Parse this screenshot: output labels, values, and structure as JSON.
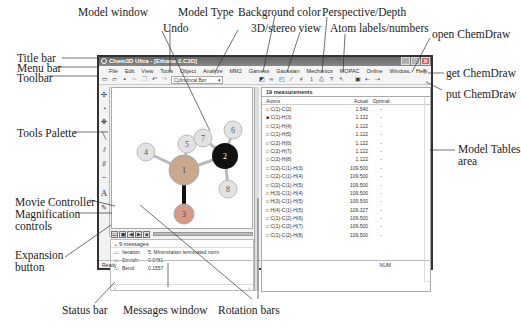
{
  "app": {
    "title": "Chem3D Ultra - [Ethane-2.C3D]",
    "window_buttons": [
      "_",
      "□",
      "X"
    ],
    "menu": [
      "File",
      "Edit",
      "View",
      "Tools",
      "Object",
      "Analyze",
      "MM2",
      "Gaussian",
      "Gaussian",
      "MOPAC Interface",
      "MOPAC",
      "Online",
      "Window",
      "Help"
    ],
    "menu_visible": [
      "File",
      "Edit",
      "View",
      "Tools",
      "Object",
      "Analyze",
      "MM2",
      "Gamess",
      "Gaussian",
      "Mechanics",
      "MOPAC",
      "Online",
      "Window",
      "Help"
    ],
    "model_type": "Cylindrical Bor",
    "toolbar_icons": [
      "new-icon",
      "open-icon",
      "save-icon",
      "cut-icon",
      "copy-icon",
      "undo-icon",
      "redo-icon",
      "model-type-select",
      "background-color-icon",
      "stereo-icon",
      "perspective-icon",
      "depth-icon",
      "atom-labels-icon",
      "atom-numbers-icon",
      "print-icon",
      "open-chemdraw-icon",
      "get-chemdraw-icon",
      "put-chemdraw-icon"
    ]
  },
  "palette": [
    "rotate",
    "select",
    "translate",
    "zoom",
    "single-bond",
    "double-bond",
    "triple-bond",
    "dummy-bond",
    "text"
  ],
  "molecule": {
    "atoms": [
      {
        "n": "1",
        "el": "C",
        "x": 72,
        "y": 82,
        "r": 15,
        "fill": "#c9a98e"
      },
      {
        "n": "2",
        "el": "C",
        "x": 113,
        "y": 68,
        "r": 13,
        "fill": "#111"
      },
      {
        "n": "3",
        "el": "H",
        "x": 72,
        "y": 126,
        "r": 10,
        "fill": "#d49a85"
      },
      {
        "n": "4",
        "el": "H",
        "x": 34,
        "y": 64,
        "r": 9,
        "fill": "#e2e2e2"
      },
      {
        "n": "5",
        "el": "H",
        "x": 75,
        "y": 56,
        "r": 9,
        "fill": "#e2e2e2"
      },
      {
        "n": "6",
        "el": "H",
        "x": 121,
        "y": 42,
        "r": 9,
        "fill": "#e2e2e2"
      },
      {
        "n": "7",
        "el": "H",
        "x": 91,
        "y": 50,
        "r": 9,
        "fill": "#e2e2e2"
      },
      {
        "n": "8",
        "el": "H",
        "x": 116,
        "y": 101,
        "r": 9,
        "fill": "#e2e2e2"
      }
    ]
  },
  "movie_buttons": [
    "◀",
    "▶",
    "|",
    "‖",
    "■"
  ],
  "messages": {
    "header": "9 messages",
    "rows": [
      {
        "key": "Iteration",
        "value": "5: Minimization terminated norm"
      },
      {
        "key": "Stretch:",
        "value": "0.0481"
      },
      {
        "key": "Bend:",
        "value": "0.1557"
      }
    ]
  },
  "tables": {
    "caption": "19 measurements",
    "columns": [
      "Atoms",
      "Actual",
      "Optimal"
    ],
    "rows": [
      {
        "atoms": "C(1)-C(2)",
        "actual": "1.540",
        "optimal": "-"
      },
      {
        "atoms": "C(1)-H(3)",
        "actual": "1.122",
        "optimal": "-"
      },
      {
        "atoms": "C(1)-H(4)",
        "actual": "1.122",
        "optimal": "-"
      },
      {
        "atoms": "C(1)-H(5)",
        "actual": "1.122",
        "optimal": "-"
      },
      {
        "atoms": "C(2)-H(6)",
        "actual": "1.122",
        "optimal": "-"
      },
      {
        "atoms": "C(2)-H(7)",
        "actual": "1.122",
        "optimal": "-"
      },
      {
        "atoms": "C(2)-H(8)",
        "actual": "1.122",
        "optimal": "-"
      },
      {
        "atoms": "C(2)-C(1)-H(3)",
        "actual": "109.500",
        "optimal": "-"
      },
      {
        "atoms": "C(2)-C(1)-H(4)",
        "actual": "109.500",
        "optimal": "-"
      },
      {
        "atoms": "C(2)-C(1)-H(5)",
        "actual": "109.500",
        "optimal": "-"
      },
      {
        "atoms": "H(3)-C(1)-H(4)",
        "actual": "109.500",
        "optimal": "-"
      },
      {
        "atoms": "H(3)-C(1)-H(5)",
        "actual": "109.500",
        "optimal": "-"
      },
      {
        "atoms": "H(4)-C(1)-H(5)",
        "actual": "109.327",
        "optimal": "-"
      },
      {
        "atoms": "C(1)-C(2)-H(6)",
        "actual": "109.500",
        "optimal": "-"
      },
      {
        "atoms": "C(1)-C(2)-H(7)",
        "actual": "109.500",
        "optimal": "-"
      },
      {
        "atoms": "C(1)-C(2)-H(8)",
        "actual": "109.500",
        "optimal": "-"
      }
    ]
  },
  "status": {
    "left": "Ready",
    "right": "NUM"
  },
  "callouts": {
    "model_window": "Model window",
    "model_type": "Model Type",
    "background_color": "Background color",
    "perspective": "Perspective/Depth",
    "undo": "Undo",
    "stereo": "3D/stereo view",
    "atom_labels": "Atom labels/numbers",
    "open_chemdraw": "open ChemDraw",
    "title_bar": "Title bar",
    "menu_bar": "Menu bar",
    "toolbar": "Toolbar",
    "get_chemdraw": "get ChemDraw",
    "put_chemdraw": "put ChemDraw",
    "tools_palette": "Tools Palette",
    "model_tables": "Model Tables",
    "model_tables_2": "area",
    "movie_controller": "Movie Controller",
    "magnification": "Magnification",
    "magnification_2": "controls",
    "expansion": "Expansion",
    "expansion_2": "button",
    "status_bar": "Status bar",
    "messages_window": "Messages window",
    "rotation_bars": "Rotation bars"
  }
}
